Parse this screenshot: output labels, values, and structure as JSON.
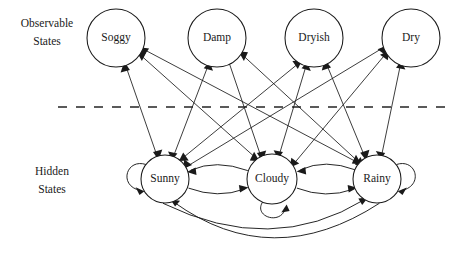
{
  "diagram": {
    "type": "hidden-markov-model",
    "title": "",
    "background_color": "#ffffff",
    "line_color": "#1a1a1a",
    "divider_color": "#5a5a5a",
    "row_labels": {
      "observable": {
        "line1": "Observable",
        "line2": "States"
      },
      "hidden": {
        "line1": "Hidden",
        "line2": "States"
      }
    },
    "observable_states": [
      {
        "id": "soggy",
        "label": "Soggy",
        "cx": 116,
        "cy": 38,
        "r": 29
      },
      {
        "id": "damp",
        "label": "Damp",
        "cx": 217,
        "cy": 38,
        "r": 29
      },
      {
        "id": "dryish",
        "label": "Dryish",
        "cx": 314,
        "cy": 38,
        "r": 29
      },
      {
        "id": "dry",
        "label": "Dry",
        "cx": 411,
        "cy": 38,
        "r": 29
      }
    ],
    "hidden_states": [
      {
        "id": "sunny",
        "label": "Sunny",
        "cx": 165,
        "cy": 179,
        "r": 24
      },
      {
        "id": "cloudy",
        "label": "Cloudy",
        "cx": 272,
        "cy": 179,
        "r": 25
      },
      {
        "id": "rainy",
        "label": "Rainy",
        "cx": 377,
        "cy": 179,
        "r": 24
      }
    ],
    "emissions": [
      {
        "from": "sunny",
        "to": "soggy"
      },
      {
        "from": "sunny",
        "to": "damp"
      },
      {
        "from": "sunny",
        "to": "dryish"
      },
      {
        "from": "sunny",
        "to": "dry"
      },
      {
        "from": "cloudy",
        "to": "soggy"
      },
      {
        "from": "cloudy",
        "to": "damp"
      },
      {
        "from": "cloudy",
        "to": "dryish"
      },
      {
        "from": "cloudy",
        "to": "dry"
      },
      {
        "from": "rainy",
        "to": "soggy"
      },
      {
        "from": "rainy",
        "to": "damp"
      },
      {
        "from": "rainy",
        "to": "dryish"
      },
      {
        "from": "rainy",
        "to": "dry"
      }
    ],
    "transitions": [
      {
        "from": "sunny",
        "to": "cloudy",
        "kind": "arc-lower"
      },
      {
        "from": "cloudy",
        "to": "sunny",
        "kind": "arc-upper"
      },
      {
        "from": "cloudy",
        "to": "rainy",
        "kind": "arc-lower"
      },
      {
        "from": "rainy",
        "to": "cloudy",
        "kind": "arc-upper"
      },
      {
        "from": "sunny",
        "to": "rainy",
        "kind": "arc-wide-inner"
      },
      {
        "from": "rainy",
        "to": "sunny",
        "kind": "arc-wide-outer"
      }
    ],
    "self_transitions": [
      {
        "state": "sunny",
        "side": "left"
      },
      {
        "state": "cloudy",
        "side": "bottom"
      },
      {
        "state": "rainy",
        "side": "right"
      }
    ],
    "divider": {
      "x1": 58,
      "x2": 452,
      "y": 107,
      "style": "dashed"
    }
  }
}
